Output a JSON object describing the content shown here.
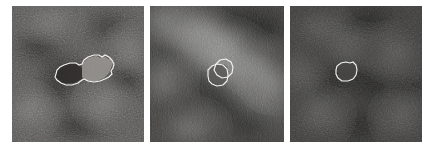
{
  "figure": {
    "type": "medical-image-panel-series",
    "modality": "grayscale ultrasound / B-mode scan",
    "panel_count": 3,
    "background_color": "#ffffff",
    "contour_color": "#f2f2f0",
    "alt": "Three grayscale scan panels each showing a white outlined lesion contour of decreasing size from left to right"
  },
  "panels": [
    {
      "id": "panel-1",
      "label": "",
      "x": 12,
      "y": 6,
      "width": 132,
      "height": 136,
      "mean_gray": "#4e4e4e",
      "description": "Mid-gray speckled tissue with a dark band running from upper-left to lower-center; one large elongated lesion contour near the middle with a brighter right lobe",
      "contours": [
        {
          "name": "lesion-outline-large",
          "centroid_x": 76,
          "centroid_y": 69,
          "approx_width_px": 48,
          "approx_height_px": 22
        }
      ]
    },
    {
      "id": "panel-2",
      "label": "",
      "x": 150,
      "y": 6,
      "width": 134,
      "height": 136,
      "mean_gray": "#343434",
      "description": "Darker panel with a bright diagonal band from upper-left to lower-right and a bright wedge at left; two small overlapping lesion contours at center",
      "contours": [
        {
          "name": "lesion-outline-primary",
          "centroid_x": 216,
          "centroid_y": 74,
          "approx_width_px": 18,
          "approx_height_px": 18
        },
        {
          "name": "lesion-outline-secondary",
          "centroid_x": 224,
          "centroid_y": 70,
          "approx_width_px": 16,
          "approx_height_px": 16
        }
      ]
    },
    {
      "id": "panel-3",
      "label": "",
      "x": 290,
      "y": 6,
      "width": 132,
      "height": 136,
      "mean_gray": "#2e2e2e",
      "description": "Darkest panel with mottled low-contrast texture and a faint diagonal streak; one small octagonal lesion contour near the center-left",
      "contours": [
        {
          "name": "lesion-outline-small",
          "centroid_x": 346,
          "centroid_y": 71,
          "approx_width_px": 20,
          "approx_height_px": 17
        }
      ]
    }
  ],
  "chart_data": {
    "type": "table",
    "title": "",
    "categories": [
      "Panel 1",
      "Panel 2",
      "Panel 3"
    ],
    "series": [
      {
        "name": "Contour count",
        "values": [
          1,
          2,
          1
        ]
      },
      {
        "name": "Lesion width (px)",
        "values": [
          48,
          18,
          20
        ]
      },
      {
        "name": "Lesion height (px)",
        "values": [
          22,
          18,
          17
        ]
      },
      {
        "name": "Panel mean gray (0-255)",
        "values": [
          78,
          52,
          46
        ]
      }
    ],
    "xlabel": "",
    "ylabel": "",
    "grid": false,
    "legend_position": "none"
  }
}
